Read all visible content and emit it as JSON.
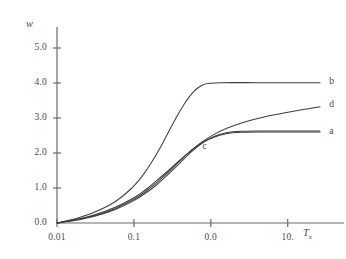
{
  "figure": {
    "background": "#ffffff",
    "ink_color": "#3d3d3d",
    "axis_color": "#6b6b6b"
  },
  "chart_data": {
    "type": "line",
    "title": "",
    "subtitle": "",
    "xlabel": "T",
    "xlabel_sub": "x",
    "ylabel": "w",
    "xscale": "log",
    "yscale": "linear",
    "grid": false,
    "legend": "inline-right-labels",
    "xtick_labels": [
      "0.01",
      "0.1",
      "0.0",
      "10."
    ],
    "xtick_decades": [
      -2,
      -1,
      0,
      1
    ],
    "ytick_labels": [
      "0.0",
      "1.0",
      "2.0",
      "3.0",
      "4.0",
      "5.0"
    ],
    "ylim": [
      0.0,
      5.6
    ],
    "xlim_decades": [
      -2,
      1.55
    ],
    "annotations": [
      {
        "text": "c",
        "x_decade": -0.07,
        "y": 2.15
      }
    ],
    "series": [
      {
        "name": "a",
        "label": "a",
        "label_x_decade": 1.5,
        "label_y": 2.6,
        "plateau": 2.6,
        "points": [
          {
            "x_decade": -2.0,
            "y": 0.0
          },
          {
            "x_decade": -1.75,
            "y": 0.1
          },
          {
            "x_decade": -1.5,
            "y": 0.24
          },
          {
            "x_decade": -1.25,
            "y": 0.44
          },
          {
            "x_decade": -1.0,
            "y": 0.72
          },
          {
            "x_decade": -0.85,
            "y": 0.95
          },
          {
            "x_decade": -0.7,
            "y": 1.22
          },
          {
            "x_decade": -0.55,
            "y": 1.5
          },
          {
            "x_decade": -0.4,
            "y": 1.8
          },
          {
            "x_decade": -0.25,
            "y": 2.08
          },
          {
            "x_decade": -0.1,
            "y": 2.31
          },
          {
            "x_decade": 0.05,
            "y": 2.46
          },
          {
            "x_decade": 0.2,
            "y": 2.55
          },
          {
            "x_decade": 0.4,
            "y": 2.59
          },
          {
            "x_decade": 0.7,
            "y": 2.6
          },
          {
            "x_decade": 1.1,
            "y": 2.6
          },
          {
            "x_decade": 1.42,
            "y": 2.6
          }
        ]
      },
      {
        "name": "b",
        "label": "b",
        "label_x_decade": 1.5,
        "label_y": 4.02,
        "plateau": 4.0,
        "points": [
          {
            "x_decade": -2.0,
            "y": 0.0
          },
          {
            "x_decade": -1.75,
            "y": 0.13
          },
          {
            "x_decade": -1.5,
            "y": 0.32
          },
          {
            "x_decade": -1.25,
            "y": 0.6
          },
          {
            "x_decade": -1.05,
            "y": 0.95
          },
          {
            "x_decade": -0.9,
            "y": 1.32
          },
          {
            "x_decade": -0.78,
            "y": 1.7
          },
          {
            "x_decade": -0.66,
            "y": 2.14
          },
          {
            "x_decade": -0.55,
            "y": 2.6
          },
          {
            "x_decade": -0.44,
            "y": 3.05
          },
          {
            "x_decade": -0.33,
            "y": 3.45
          },
          {
            "x_decade": -0.22,
            "y": 3.76
          },
          {
            "x_decade": -0.12,
            "y": 3.93
          },
          {
            "x_decade": -0.02,
            "y": 3.99
          },
          {
            "x_decade": 0.15,
            "y": 4.01
          },
          {
            "x_decade": 0.6,
            "y": 4.01
          },
          {
            "x_decade": 1.1,
            "y": 4.01
          },
          {
            "x_decade": 1.42,
            "y": 4.01
          }
        ]
      },
      {
        "name": "c",
        "label": "c",
        "label_x_decade": -0.07,
        "label_y": 2.15,
        "plateau": 2.62,
        "points": [
          {
            "x_decade": -2.0,
            "y": 0.0
          },
          {
            "x_decade": -1.75,
            "y": 0.08
          },
          {
            "x_decade": -1.5,
            "y": 0.2
          },
          {
            "x_decade": -1.25,
            "y": 0.38
          },
          {
            "x_decade": -1.0,
            "y": 0.64
          },
          {
            "x_decade": -0.85,
            "y": 0.85
          },
          {
            "x_decade": -0.7,
            "y": 1.1
          },
          {
            "x_decade": -0.55,
            "y": 1.4
          },
          {
            "x_decade": -0.4,
            "y": 1.72
          },
          {
            "x_decade": -0.25,
            "y": 2.04
          },
          {
            "x_decade": -0.1,
            "y": 2.3
          },
          {
            "x_decade": 0.05,
            "y": 2.48
          },
          {
            "x_decade": 0.2,
            "y": 2.58
          },
          {
            "x_decade": 0.4,
            "y": 2.62
          },
          {
            "x_decade": 0.7,
            "y": 2.63
          },
          {
            "x_decade": 1.1,
            "y": 2.63
          },
          {
            "x_decade": 1.42,
            "y": 2.63
          }
        ]
      },
      {
        "name": "d",
        "label": "d",
        "label_x_decade": 1.5,
        "label_y": 3.35,
        "plateau": null,
        "points": [
          {
            "x_decade": -2.0,
            "y": 0.0
          },
          {
            "x_decade": -1.75,
            "y": 0.09
          },
          {
            "x_decade": -1.5,
            "y": 0.22
          },
          {
            "x_decade": -1.25,
            "y": 0.41
          },
          {
            "x_decade": -1.0,
            "y": 0.68
          },
          {
            "x_decade": -0.85,
            "y": 0.9
          },
          {
            "x_decade": -0.7,
            "y": 1.16
          },
          {
            "x_decade": -0.55,
            "y": 1.46
          },
          {
            "x_decade": -0.4,
            "y": 1.78
          },
          {
            "x_decade": -0.25,
            "y": 2.08
          },
          {
            "x_decade": -0.1,
            "y": 2.34
          },
          {
            "x_decade": 0.05,
            "y": 2.54
          },
          {
            "x_decade": 0.2,
            "y": 2.7
          },
          {
            "x_decade": 0.4,
            "y": 2.86
          },
          {
            "x_decade": 0.65,
            "y": 3.01
          },
          {
            "x_decade": 0.95,
            "y": 3.14
          },
          {
            "x_decade": 1.2,
            "y": 3.24
          },
          {
            "x_decade": 1.42,
            "y": 3.32
          }
        ]
      }
    ]
  }
}
